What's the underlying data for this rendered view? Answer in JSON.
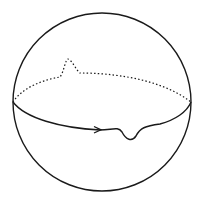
{
  "diagram": {
    "type": "sphere-with-equator",
    "colors": {
      "stroke": "#1a1a1a",
      "background": "#ffffff"
    },
    "sphere": {
      "cx": 102,
      "cy": 102,
      "r": 89
    },
    "equator": {
      "back_style": "dotted",
      "front_style": "solid",
      "arrow_direction": "right"
    }
  }
}
